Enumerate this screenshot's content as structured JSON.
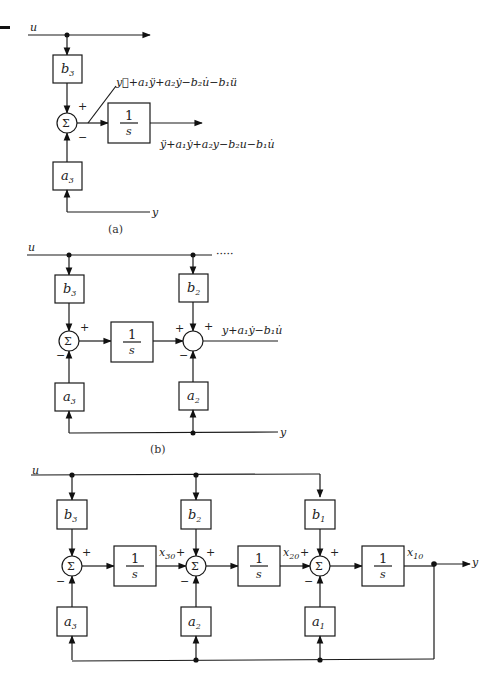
{
  "diagram": {
    "page_mark": "—",
    "part_a": {
      "caption": "(a)",
      "input": "u",
      "output_feedback": "y",
      "gain_top": {
        "sym": "b",
        "sub": "3"
      },
      "gain_bottom": {
        "sym": "a",
        "sub": "3"
      },
      "sum_symbol": "Σ",
      "sign_top": "+",
      "sign_bottom": "−",
      "integrator": {
        "num": "1",
        "den": "s"
      },
      "signal_in": "y⃛+a₁ÿ+a₂ẏ−b₂u̇−b₁ü",
      "signal_out": "ÿ+a₁ẏ+a₂y−b₂u−b₁u̇"
    },
    "part_b": {
      "caption": "(b)",
      "input": "u",
      "continuation": "·····",
      "output_feedback": "y",
      "gain_top_1": {
        "sym": "b",
        "sub": "3"
      },
      "gain_top_2": {
        "sym": "b",
        "sub": "2"
      },
      "gain_bottom_1": {
        "sym": "a",
        "sub": "3"
      },
      "gain_bottom_2": {
        "sym": "a",
        "sub": "2"
      },
      "sum_symbol": "Σ",
      "plus": "+",
      "minus": "−",
      "integrator": {
        "num": "1",
        "den": "s"
      },
      "signal_out": "y+a₁ẏ−b₁u̇"
    },
    "part_c": {
      "input": "u",
      "output": "y",
      "gains_top": [
        {
          "sym": "b",
          "sub": "3"
        },
        {
          "sym": "b",
          "sub": "2"
        },
        {
          "sym": "b",
          "sub": "1"
        }
      ],
      "gains_bottom": [
        {
          "sym": "a",
          "sub": "3"
        },
        {
          "sym": "a",
          "sub": "2"
        },
        {
          "sym": "a",
          "sub": "1"
        }
      ],
      "sum_symbol": "Σ",
      "plus": "+",
      "minus": "−",
      "integrator": {
        "num": "1",
        "den": "s"
      },
      "states": [
        {
          "sym": "x",
          "sub": "30"
        },
        {
          "sym": "x",
          "sub": "20"
        },
        {
          "sym": "x",
          "sub": "10"
        }
      ]
    }
  }
}
